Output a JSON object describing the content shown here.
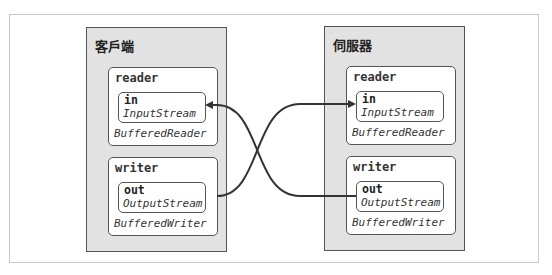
{
  "diagram": {
    "type": "socket-stream-connection",
    "panels": [
      {
        "id": "client",
        "title": "客戶端",
        "reader": {
          "label": "reader",
          "field": "in",
          "field_type": "InputStream",
          "wrapper_type": "BufferedReader"
        },
        "writer": {
          "label": "writer",
          "field": "out",
          "field_type": "OutputStream",
          "wrapper_type": "BufferedWriter"
        }
      },
      {
        "id": "server",
        "title": "伺服器",
        "reader": {
          "label": "reader",
          "field": "in",
          "field_type": "InputStream",
          "wrapper_type": "BufferedReader"
        },
        "writer": {
          "label": "writer",
          "field": "out",
          "field_type": "OutputStream",
          "wrapper_type": "BufferedWriter"
        }
      }
    ],
    "connections": [
      {
        "from": "client.writer.out",
        "to": "server.reader.in"
      },
      {
        "from": "server.writer.out",
        "to": "client.reader.in"
      }
    ],
    "colors": {
      "panel_fill": "#e2e2e2",
      "border": "#555555",
      "arrow": "#333333",
      "frame": "#c8c8c8"
    }
  }
}
